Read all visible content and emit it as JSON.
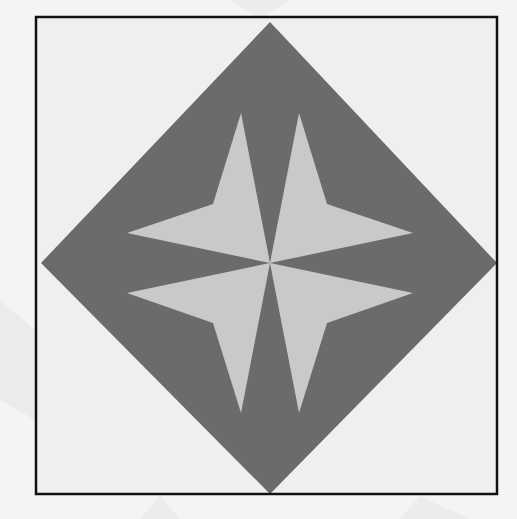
{
  "figure": {
    "title": "Quilt block: four-pointed star in diamond",
    "colors": {
      "background": "#f4f4f4",
      "panel": "#efefef",
      "watermark": "#e2e2e2",
      "frame": "#111111",
      "diamond": "#6b6b6b",
      "star": "#c9c9c9"
    },
    "frame": {
      "x": 36,
      "y": 17,
      "width": 461,
      "height": 477,
      "stroke_width": 2.5
    },
    "diamond": {
      "points": "270,22 497,263 270,494 41,263"
    },
    "star": {
      "center": [
        270,
        263
      ],
      "arms": [
        {
          "name": "upper-left",
          "points": "270,263 241,113 213,204 127,233"
        },
        {
          "name": "upper-right",
          "points": "270,263 299,113 327,204 413,233"
        },
        {
          "name": "lower-left",
          "points": "270,263 127,293 213,323 241,413"
        },
        {
          "name": "lower-right",
          "points": "270,263 413,293 327,323 299,413"
        }
      ]
    }
  }
}
